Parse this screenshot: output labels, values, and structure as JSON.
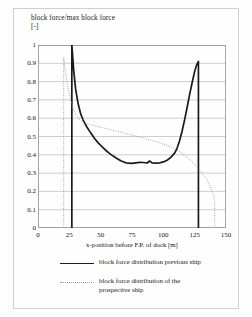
{
  "chart_data": {
    "type": "line",
    "title": "block force/max block force\n[-]",
    "xlabel": "x-position before F.P. of dock [m]",
    "ylabel": "",
    "xlim": [
      0,
      150
    ],
    "ylim": [
      0,
      1
    ],
    "xticks": [
      0,
      25,
      50,
      75,
      100,
      125,
      150
    ],
    "xtick_labels": [
      "0",
      "25",
      "50",
      "75",
      "100",
      "125",
      "150"
    ],
    "yticks": [
      0,
      0.1,
      0.2,
      0.3,
      0.4,
      0.5,
      0.6,
      0.7,
      0.8,
      0.9,
      1
    ],
    "ytick_labels": [
      "0",
      "0.1",
      "0.2",
      "0.3",
      "0.4",
      "0.5",
      "0.6",
      "0.7",
      "0.8",
      "0.9",
      "1"
    ],
    "grid": "horizontal",
    "legend_position": "below",
    "series": [
      {
        "name": "block force distribution previous ship",
        "style": "solid",
        "color": "#1b1b1b",
        "points": [
          [
            27.0,
            0.0
          ],
          [
            27.0,
            1.0
          ],
          [
            28.5,
            0.86
          ],
          [
            30.0,
            0.76
          ],
          [
            32.0,
            0.68
          ],
          [
            34.0,
            0.625
          ],
          [
            36.0,
            0.59
          ],
          [
            39.0,
            0.552
          ],
          [
            42.0,
            0.52
          ],
          [
            45.0,
            0.49
          ],
          [
            48.0,
            0.465
          ],
          [
            51.0,
            0.445
          ],
          [
            54.0,
            0.425
          ],
          [
            57.0,
            0.408
          ],
          [
            60.0,
            0.393
          ],
          [
            63.0,
            0.38
          ],
          [
            66.0,
            0.368
          ],
          [
            69.0,
            0.359
          ],
          [
            72.0,
            0.354
          ],
          [
            75.0,
            0.353
          ],
          [
            78.0,
            0.356
          ],
          [
            81.0,
            0.359
          ],
          [
            84.0,
            0.358
          ],
          [
            87.0,
            0.355
          ],
          [
            89.0,
            0.366
          ],
          [
            91.0,
            0.356
          ],
          [
            94.0,
            0.354
          ],
          [
            97.0,
            0.356
          ],
          [
            100.0,
            0.361
          ],
          [
            103.0,
            0.37
          ],
          [
            106.0,
            0.386
          ],
          [
            109.0,
            0.409
          ],
          [
            111.0,
            0.437
          ],
          [
            113.0,
            0.478
          ],
          [
            115.0,
            0.53
          ],
          [
            117.0,
            0.592
          ],
          [
            119.0,
            0.66
          ],
          [
            121.0,
            0.73
          ],
          [
            123.0,
            0.795
          ],
          [
            125.0,
            0.855
          ],
          [
            126.5,
            0.89
          ],
          [
            128.0,
            0.91
          ],
          [
            128.0,
            0.0
          ]
        ]
      },
      {
        "name": "block force distribution of the\nprospective ship",
        "style": "dotted",
        "color": "#9a9a9a",
        "points": [
          [
            20.5,
            0.0
          ],
          [
            20.5,
            0.932
          ],
          [
            22.0,
            0.845
          ],
          [
            24.0,
            0.76
          ],
          [
            26.0,
            0.7
          ],
          [
            28.0,
            0.655
          ],
          [
            30.0,
            0.62
          ],
          [
            33.0,
            0.592
          ],
          [
            36.0,
            0.578
          ],
          [
            40.0,
            0.568
          ],
          [
            45.0,
            0.56
          ],
          [
            50.0,
            0.551
          ],
          [
            55.0,
            0.542
          ],
          [
            60.0,
            0.533
          ],
          [
            65.0,
            0.525
          ],
          [
            70.0,
            0.516
          ],
          [
            75.0,
            0.508
          ],
          [
            80.0,
            0.499
          ],
          [
            85.0,
            0.49
          ],
          [
            90.0,
            0.48
          ],
          [
            95.0,
            0.47
          ],
          [
            100.0,
            0.459
          ],
          [
            105.0,
            0.446
          ],
          [
            110.0,
            0.43
          ],
          [
            115.0,
            0.408
          ],
          [
            120.0,
            0.38
          ],
          [
            125.0,
            0.348
          ],
          [
            130.0,
            0.31
          ],
          [
            135.0,
            0.262
          ],
          [
            139.0,
            0.2
          ],
          [
            140.5,
            0.172
          ],
          [
            141.0,
            0.148
          ],
          [
            141.0,
            0.0
          ]
        ]
      }
    ]
  },
  "legend": {
    "entries": [
      {
        "label": "block force distribution previous ship",
        "style": "solid"
      },
      {
        "label": "block force distribution of the\nprospective ship",
        "style": "dotted"
      }
    ]
  }
}
